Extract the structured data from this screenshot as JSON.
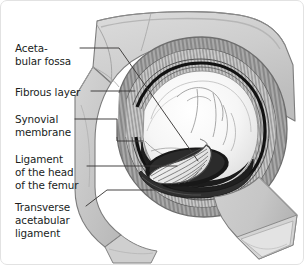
{
  "figure": {
    "background_color": "#ffffff",
    "border_color": "#e2e2e2",
    "text_color": "#201d1c"
  },
  "labels": [
    {
      "id": "acetabular-fossa",
      "text": "Aceta-\nbular fossa",
      "x": 14,
      "y": 41
    },
    {
      "id": "fibrous-layer",
      "text": "Fibrous layer",
      "x": 14,
      "y": 85
    },
    {
      "id": "synovial-membrane",
      "text": "Synovial\nmembrane",
      "x": 14,
      "y": 112
    },
    {
      "id": "ligament-of-head-of-femur",
      "text": "Ligament\nof the head\nof the femur",
      "x": 14,
      "y": 152
    },
    {
      "id": "transverse-acetabular-ligament",
      "text": "Transverse\nacetabular\nligament",
      "x": 14,
      "y": 200
    }
  ],
  "colors": {
    "bone_light": "#d8d8d8",
    "bone_mid": "#c3c3c3",
    "bone_dark": "#a8a8a8",
    "capsule_hatch": "#9b9b9b",
    "fossa_dark": "#1d1d1d",
    "cartilage": "#f3f3f3",
    "outline": "#4a4a4a",
    "leader": "#3c3a39"
  },
  "structures": [
    {
      "name": "ilium-pelvic-bone",
      "description": "Large pale grey bone mass upper right"
    },
    {
      "name": "fibrous-capsule-rim",
      "description": "Hatched crescent rim around acetabulum"
    },
    {
      "name": "synovial-membrane-ring",
      "description": "Thin dark ring inside fibrous layer"
    },
    {
      "name": "femoral-head",
      "description": "Large pale rounded head filling acetabulum"
    },
    {
      "name": "acetabular-fossa",
      "description": "Dark recess at base of acetabulum"
    },
    {
      "name": "ligament-of-head-of-femur",
      "description": "Fan-shaped striated ligament in fossa"
    },
    {
      "name": "transverse-acetabular-ligament",
      "description": "Band bridging the acetabular notch"
    },
    {
      "name": "femoral-shaft",
      "description": "Cut shaft extending to lower right"
    }
  ]
}
